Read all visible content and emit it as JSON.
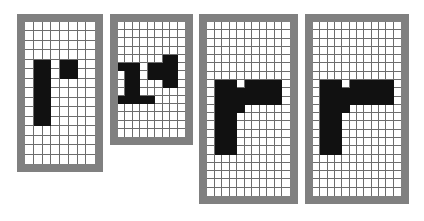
{
  "figure": {
    "background_color": "#ffffff",
    "frame_color": "#808080",
    "grid_line_color": "#6d6d6d",
    "cell_on_color": "#111111",
    "cell_off_color": "#ffffff",
    "panel_count": 4
  },
  "panels": [
    {
      "name": "panel-1",
      "label": "r-bitmap-coarse",
      "x": 17,
      "y": 14,
      "width": 86,
      "height": 158,
      "frame": 8,
      "cols": 8,
      "rows": 15,
      "cell_size": 8.8,
      "on_cells": [
        [
          4,
          1
        ],
        [
          4,
          2
        ],
        [
          5,
          1
        ],
        [
          5,
          2
        ],
        [
          6,
          1
        ],
        [
          6,
          2
        ],
        [
          7,
          1
        ],
        [
          7,
          2
        ],
        [
          8,
          1
        ],
        [
          8,
          2
        ],
        [
          9,
          1
        ],
        [
          9,
          2
        ],
        [
          10,
          1
        ],
        [
          10,
          2
        ],
        [
          4,
          4
        ],
        [
          4,
          5
        ],
        [
          5,
          4
        ],
        [
          5,
          5
        ]
      ]
    },
    {
      "name": "panel-2",
      "label": "r-bitmap-medium",
      "x": 110,
      "y": 14,
      "width": 83,
      "height": 131,
      "frame": 8,
      "cols": 9,
      "rows": 14,
      "cell_size": 7.5,
      "on_cells": [
        [
          5,
          0
        ],
        [
          5,
          1
        ],
        [
          5,
          2
        ],
        [
          6,
          1
        ],
        [
          6,
          2
        ],
        [
          7,
          1
        ],
        [
          7,
          2
        ],
        [
          8,
          1
        ],
        [
          8,
          2
        ],
        [
          9,
          0
        ],
        [
          9,
          1
        ],
        [
          9,
          2
        ],
        [
          9,
          3
        ],
        [
          9,
          4
        ],
        [
          5,
          4
        ],
        [
          5,
          5
        ],
        [
          5,
          6
        ],
        [
          5,
          7
        ],
        [
          6,
          4
        ],
        [
          6,
          5
        ],
        [
          6,
          6
        ],
        [
          6,
          7
        ],
        [
          7,
          6
        ],
        [
          7,
          7
        ],
        [
          4,
          6
        ],
        [
          4,
          7
        ]
      ]
    },
    {
      "name": "panel-3",
      "label": "r-bitmap-fine",
      "x": 199,
      "y": 14,
      "width": 99,
      "height": 190,
      "frame": 8,
      "cols": 11,
      "rows": 21,
      "cell_size": 7.6,
      "on_cells": [
        [
          7,
          1
        ],
        [
          7,
          2
        ],
        [
          7,
          3
        ],
        [
          8,
          1
        ],
        [
          8,
          2
        ],
        [
          8,
          3
        ],
        [
          9,
          1
        ],
        [
          9,
          2
        ],
        [
          9,
          3
        ],
        [
          10,
          1
        ],
        [
          10,
          2
        ],
        [
          10,
          3
        ],
        [
          11,
          1
        ],
        [
          11,
          2
        ],
        [
          11,
          3
        ],
        [
          12,
          1
        ],
        [
          12,
          2
        ],
        [
          12,
          3
        ],
        [
          13,
          1
        ],
        [
          13,
          2
        ],
        [
          13,
          3
        ],
        [
          14,
          1
        ],
        [
          14,
          2
        ],
        [
          14,
          3
        ],
        [
          15,
          1
        ],
        [
          15,
          2
        ],
        [
          15,
          3
        ],
        [
          7,
          5
        ],
        [
          7,
          6
        ],
        [
          7,
          7
        ],
        [
          7,
          8
        ],
        [
          7,
          9
        ],
        [
          8,
          4
        ],
        [
          8,
          5
        ],
        [
          8,
          6
        ],
        [
          8,
          7
        ],
        [
          8,
          8
        ],
        [
          8,
          9
        ],
        [
          9,
          4
        ],
        [
          9,
          5
        ],
        [
          9,
          6
        ],
        [
          9,
          7
        ],
        [
          9,
          8
        ],
        [
          9,
          9
        ],
        [
          10,
          4
        ]
      ]
    },
    {
      "name": "panel-4",
      "label": "r-bitmap-finest",
      "x": 305,
      "y": 14,
      "width": 104,
      "height": 190,
      "frame": 8,
      "cols": 12,
      "rows": 21,
      "cell_size": 7.3,
      "on_cells": [
        [
          7,
          1
        ],
        [
          7,
          2
        ],
        [
          7,
          3
        ],
        [
          8,
          1
        ],
        [
          8,
          2
        ],
        [
          8,
          3
        ],
        [
          9,
          1
        ],
        [
          9,
          2
        ],
        [
          9,
          3
        ],
        [
          10,
          1
        ],
        [
          10,
          2
        ],
        [
          10,
          3
        ],
        [
          11,
          1
        ],
        [
          11,
          2
        ],
        [
          11,
          3
        ],
        [
          12,
          1
        ],
        [
          12,
          2
        ],
        [
          12,
          3
        ],
        [
          13,
          1
        ],
        [
          13,
          2
        ],
        [
          13,
          3
        ],
        [
          14,
          1
        ],
        [
          14,
          2
        ],
        [
          14,
          3
        ],
        [
          15,
          1
        ],
        [
          15,
          2
        ],
        [
          15,
          3
        ],
        [
          7,
          5
        ],
        [
          7,
          6
        ],
        [
          7,
          7
        ],
        [
          7,
          8
        ],
        [
          7,
          9
        ],
        [
          7,
          10
        ],
        [
          8,
          4
        ],
        [
          8,
          5
        ],
        [
          8,
          6
        ],
        [
          8,
          7
        ],
        [
          8,
          8
        ],
        [
          8,
          9
        ],
        [
          8,
          10
        ],
        [
          9,
          4
        ],
        [
          9,
          5
        ],
        [
          9,
          6
        ],
        [
          9,
          7
        ],
        [
          9,
          8
        ],
        [
          9,
          9
        ],
        [
          9,
          10
        ],
        [
          10,
          4
        ]
      ]
    }
  ]
}
